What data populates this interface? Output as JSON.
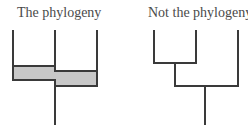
{
  "panels": {
    "left": {
      "title": "The phylogeny"
    },
    "right": {
      "title": "Not the phylogeny"
    }
  },
  "colors": {
    "line": "#3a3a3a",
    "band_fill": "#c8c8c8",
    "text": "#4a4a4a"
  }
}
